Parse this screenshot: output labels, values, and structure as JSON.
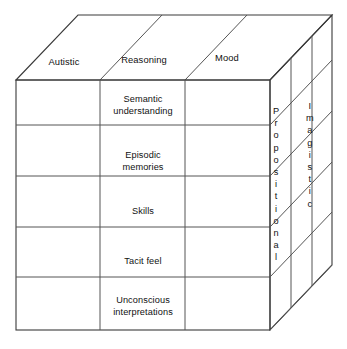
{
  "diagram": {
    "type": "3d-cube-matrix",
    "line_color": "#3a3a3a",
    "background_color": "#ffffff",
    "text_color": "#111111",
    "top_face": {
      "label": "columns",
      "headers": [
        {
          "label": "Autistic"
        },
        {
          "label": "Reasoning"
        },
        {
          "label": "Mood"
        }
      ]
    },
    "front_face": {
      "columns": 3,
      "rows": [
        {
          "label": "Semantic\nunderstanding"
        },
        {
          "label": "Episodic\nmemories"
        },
        {
          "label": "Skills"
        },
        {
          "label": "Tacit feel"
        },
        {
          "label": "Unconscious\ninterpretations"
        }
      ]
    },
    "right_face": {
      "panels": [
        {
          "label": "Propositional",
          "letters": [
            "P",
            "r",
            "o",
            "p",
            "o",
            "s",
            "i",
            "t",
            "i",
            "o",
            "n",
            "a",
            "l"
          ]
        },
        {
          "label": "Imagistic",
          "letters": [
            "I",
            "m",
            "a",
            "g",
            "i",
            "s",
            "t",
            "i",
            "c"
          ]
        }
      ]
    }
  }
}
